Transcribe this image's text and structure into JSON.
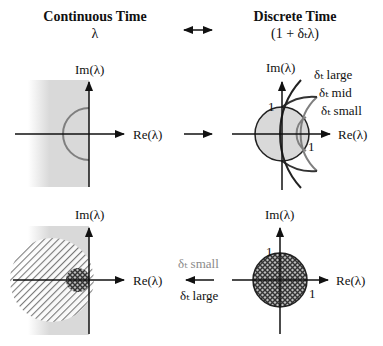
{
  "header": {
    "left_title": "Continuous Time",
    "left_expr": "λ",
    "right_title": "Discrete Time",
    "right_expr": "(1 + δₜλ)",
    "mapping_arrow": "↔"
  },
  "panels": {
    "top_left": {
      "x_axis_label": "Re(λ)",
      "y_axis_label": "Im(λ)"
    },
    "top_right": {
      "x_axis_label": "Re(λ)",
      "y_axis_label": "Im(λ)",
      "unit_label_top": "1",
      "unit_label_right": "1",
      "curves": [
        {
          "label": "δₜ large"
        },
        {
          "label": "δₜ mid"
        },
        {
          "label": "δₜ small"
        }
      ]
    },
    "bottom_left": {
      "x_axis_label": "Re(λ)",
      "y_axis_label": "Im(λ)"
    },
    "bottom_right": {
      "x_axis_label": "Re(λ)",
      "y_axis_label": "Im(λ)",
      "unit_label_top": "1",
      "unit_label_right": "1"
    }
  },
  "between": {
    "top_arrow": "→",
    "bottom_arrow": "←",
    "bottom_label_small": "δₜ small",
    "bottom_label_large": "δₜ large"
  },
  "colors": {
    "axis": "#111111",
    "region_gray": "#d9d9d9",
    "curve_gray": "#7f7f7f",
    "hatch": "#555555",
    "gray_text": "#8a8a8a"
  }
}
